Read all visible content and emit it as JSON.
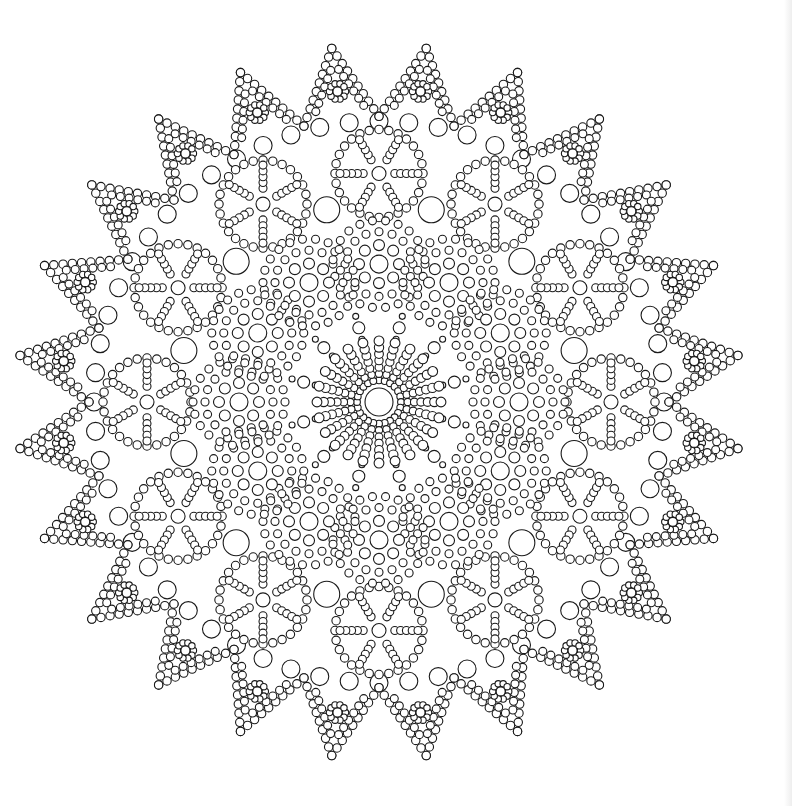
{
  "page": {
    "background": "#ffffff",
    "line_color": "#1a1a1a",
    "edge_shade": "#eeeeee"
  },
  "mandala": {
    "name": "circle-dot-mandala",
    "center": [
      379,
      402
    ],
    "scale_x": 1.0,
    "scale_y": 0.985,
    "center_circle_radius": 14,
    "center_spokes": {
      "count": 24,
      "inner": 22,
      "outer": 62,
      "dot_r": 3.4
    },
    "inner_links": {
      "count": 12,
      "radius": 78,
      "offset_deg": 15,
      "r": 6
    },
    "inner_rosettes": {
      "count": 12,
      "radius": 140,
      "offset_deg": 0,
      "rings": [
        {
          "r": 0,
          "n": 1,
          "dot": 9
        },
        {
          "r": 20,
          "n": 8,
          "dot": 5.5
        },
        {
          "r": 34,
          "n": 16,
          "dot": 4
        },
        {
          "r": 46,
          "n": 22,
          "dot": 4
        }
      ]
    },
    "big_circles": {
      "count": 12,
      "radius": 202,
      "offset_deg": 15,
      "r": 13
    },
    "wheels": {
      "count": 12,
      "radius": 232,
      "offset_deg": 0,
      "rim_r": 44,
      "rim_dots": 28,
      "rim_dot_r": 4.2,
      "spokes": 6,
      "spoke_dots": 5,
      "hub_r": 7
    },
    "outer_chain": {
      "count": 60,
      "radius": 285,
      "r": 9
    },
    "spikes": {
      "count": 24,
      "offset_deg": 7.5,
      "base_radius": 290,
      "tip_radius": 362,
      "half_width_deg": 7.5,
      "dot_r": 4.2,
      "flower_radius": 318,
      "flower_petals": 10,
      "flower_petal_r": 3.2,
      "flower_ring": 8
    }
  }
}
